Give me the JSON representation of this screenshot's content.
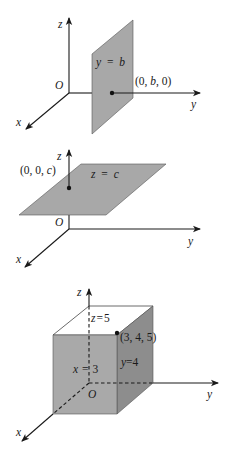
{
  "figures": [
    {
      "name": "plane-y-equals-b",
      "axes": {
        "x": "x",
        "y": "y",
        "z": "z",
        "origin": "O"
      },
      "plane_label_lhs": "y",
      "plane_label_eq": "=",
      "plane_label_rhs": "b",
      "point_label": "(0, b, 0)",
      "point_parts": [
        "(0, ",
        "b",
        ", 0)"
      ]
    },
    {
      "name": "plane-z-equals-c",
      "axes": {
        "x": "x",
        "y": "y",
        "z": "z",
        "origin": "O"
      },
      "plane_label_lhs": "z",
      "plane_label_eq": "=",
      "plane_label_rhs": "c",
      "point_label": "(0, 0, c)",
      "point_parts": [
        "(0, 0, ",
        "c",
        ")"
      ]
    },
    {
      "name": "box-3-4-5",
      "axes": {
        "x": "x",
        "y": "y",
        "z": "z",
        "origin": "O"
      },
      "face_labels": {
        "top": {
          "lhs": "z",
          "eq": "=",
          "rhs": "5"
        },
        "front": {
          "lhs": "x",
          "eq": "=",
          "rhs": "3"
        },
        "side": {
          "lhs": "y",
          "eq": "=",
          "rhs": "4"
        }
      },
      "point_label": "(3, 4, 5)"
    }
  ],
  "colors": {
    "plane": "#a8a8a8",
    "front_face": "#a9a9a9",
    "side_face": "#8d8d8d",
    "axis": "#1a1a1a"
  }
}
